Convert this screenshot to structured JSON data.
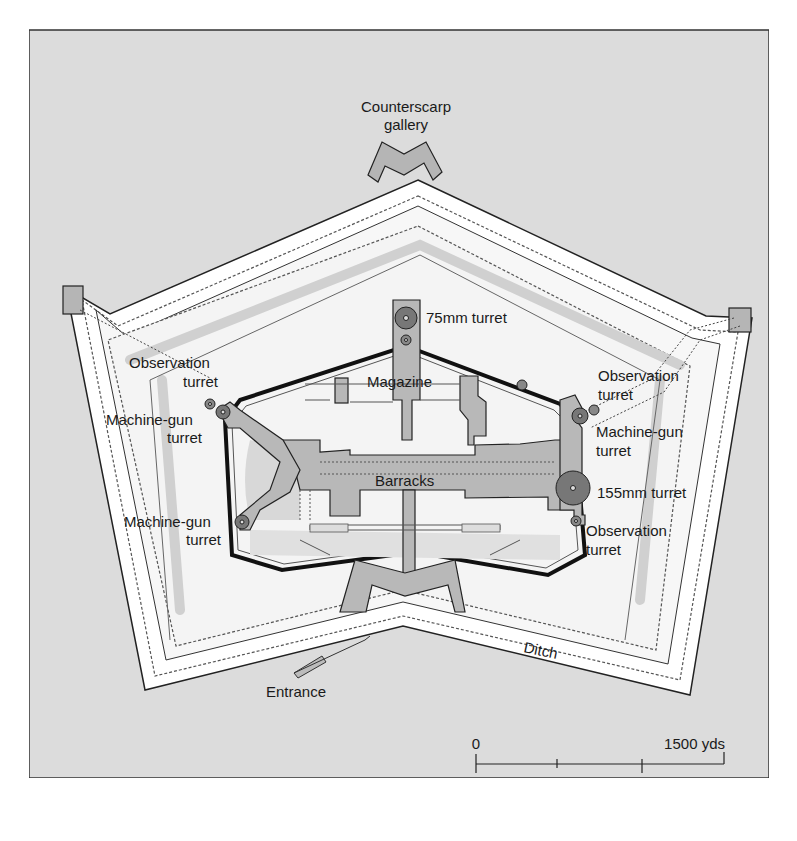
{
  "diagram": {
    "colors": {
      "background": "#dcdcdc",
      "ground_light": "#f4f4f4",
      "ditch_white": "#ffffff",
      "concrete": "#b8b8b8",
      "turret": "#777777",
      "outline": "#222222",
      "shade": "#d2d2d2"
    },
    "labels": {
      "counterscarp_line1": "Counterscarp",
      "counterscarp_line2": "gallery",
      "turret_75": "75mm turret",
      "magazine": "Magazine",
      "barracks": "Barracks",
      "obs_left_line1": "Observation",
      "obs_left_line2": "turret",
      "mg_left_top_line1": "Machine-gun",
      "mg_left_top_line2": "turret",
      "mg_left_bottom_line1": "Machine-gun",
      "mg_left_bottom_line2": "turret",
      "obs_right_top_line1": "Observation",
      "obs_right_top_line2": "turret",
      "mg_right_line1": "Machine-gun",
      "mg_right_line2": "turret",
      "turret_155": "155mm turret",
      "obs_right_bottom_line1": "Observation",
      "obs_right_bottom_line2": "turret",
      "ditch": "Ditch",
      "entrance": "Entrance"
    },
    "scale_bar": {
      "top_left": "0",
      "top_right": "1500 yds",
      "bottom_left": "0",
      "bottom_mid": "100 m"
    }
  }
}
